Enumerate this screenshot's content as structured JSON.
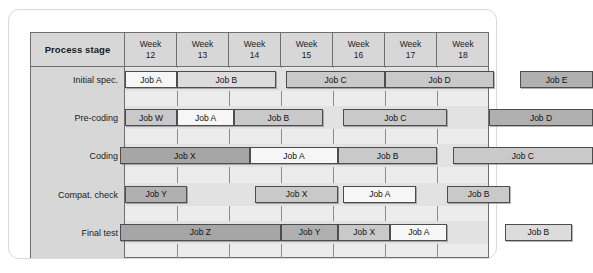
{
  "chart_data": {
    "type": "table",
    "header": {
      "stage_label": "Process stage",
      "week_prefix": "Week",
      "weeks": [
        "12",
        "13",
        "14",
        "15",
        "16",
        "17",
        "18"
      ]
    },
    "xlabel": "Week",
    "ylabel": "Process stage",
    "grid": true,
    "legend": "none",
    "rows": [
      {
        "stage": "Initial spec.",
        "bars": [
          {
            "label": "Job A",
            "start_week": 12.0,
            "end_week": 13.0,
            "shade": "f-white"
          },
          {
            "label": "Job B",
            "start_week": 13.0,
            "end_week": 14.9,
            "shade": "f-light"
          },
          {
            "label": "Job C",
            "start_week": 15.1,
            "end_week": 17.0,
            "shade": "f-med"
          },
          {
            "label": "Job D",
            "start_week": 17.0,
            "end_week": 19.1,
            "shade": "f-med"
          },
          {
            "label": "Job E",
            "start_week": 19.6,
            "end_week": 21.0,
            "shade": "f-dark"
          }
        ]
      },
      {
        "stage": "Pre-coding",
        "bars": [
          {
            "label": "Job W",
            "start_week": 12.0,
            "end_week": 13.0,
            "shade": "f-med"
          },
          {
            "label": "Job A",
            "start_week": 13.0,
            "end_week": 14.1,
            "shade": "f-white"
          },
          {
            "label": "Job B",
            "start_week": 14.1,
            "end_week": 15.8,
            "shade": "f-med"
          },
          {
            "label": "Job C",
            "start_week": 16.2,
            "end_week": 18.2,
            "shade": "f-med"
          },
          {
            "label": "Job D",
            "start_week": 19.0,
            "end_week": 21.0,
            "shade": "f-dark"
          }
        ]
      },
      {
        "stage": "Coding",
        "bars": [
          {
            "label": "Job X",
            "start_week": 11.9,
            "end_week": 14.4,
            "shade": "f-darker"
          },
          {
            "label": "Job A",
            "start_week": 14.4,
            "end_week": 16.1,
            "shade": "f-white"
          },
          {
            "label": "Job B",
            "start_week": 16.1,
            "end_week": 18.0,
            "shade": "f-med"
          },
          {
            "label": "Job C",
            "start_week": 18.3,
            "end_week": 21.0,
            "shade": "f-med"
          }
        ]
      },
      {
        "stage": "Compat. check",
        "bars": [
          {
            "label": "Job Y",
            "start_week": 12.0,
            "end_week": 13.2,
            "shade": "f-dark"
          },
          {
            "label": "Job X",
            "start_week": 14.5,
            "end_week": 16.1,
            "shade": "f-med"
          },
          {
            "label": "Job A",
            "start_week": 16.2,
            "end_week": 17.6,
            "shade": "f-white"
          },
          {
            "label": "Job B",
            "start_week": 18.2,
            "end_week": 19.4,
            "shade": "f-med"
          }
        ]
      },
      {
        "stage": "Final test",
        "bars": [
          {
            "label": "Job Z",
            "start_week": 11.9,
            "end_week": 15.0,
            "shade": "f-darker"
          },
          {
            "label": "Job Y",
            "start_week": 15.0,
            "end_week": 16.1,
            "shade": "f-dark"
          },
          {
            "label": "Job X",
            "start_week": 16.1,
            "end_week": 17.1,
            "shade": "f-med"
          },
          {
            "label": "Job A",
            "start_week": 17.1,
            "end_week": 18.2,
            "shade": "f-white"
          },
          {
            "label": "Job B",
            "start_week": 19.3,
            "end_week": 20.6,
            "shade": "f-light"
          }
        ]
      }
    ],
    "colors": {
      "header_bg": "#d7d7d7",
      "body_bg": "#ececec",
      "band_bg": "#e2e2e2",
      "gridline": "#8a8a8a",
      "border": "#6e6e6e",
      "bar_white": "#f6f6f6",
      "bar_light": "#dcdcdc",
      "bar_medium": "#c9c9c9",
      "bar_dark": "#b0b0b0",
      "bar_darker": "#a6a6a6"
    }
  }
}
